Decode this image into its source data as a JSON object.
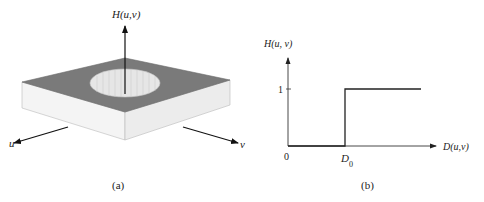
{
  "figure_a": {
    "caption": "(a)",
    "vertical_axis_label": "H(u,v)",
    "u_axis_label": "u",
    "v_axis_label": "v",
    "colors": {
      "top_surface": "#7a7a7a",
      "sides": "#f2f2f2",
      "hole": "#e8e8e8"
    }
  },
  "figure_b": {
    "caption": "(b)",
    "y_axis_label": "H(u, v)",
    "x_axis_label": "D(u,v)",
    "y_tick_label": "1",
    "origin_label": "0",
    "cutoff_label": "D",
    "cutoff_subscript": "0"
  }
}
